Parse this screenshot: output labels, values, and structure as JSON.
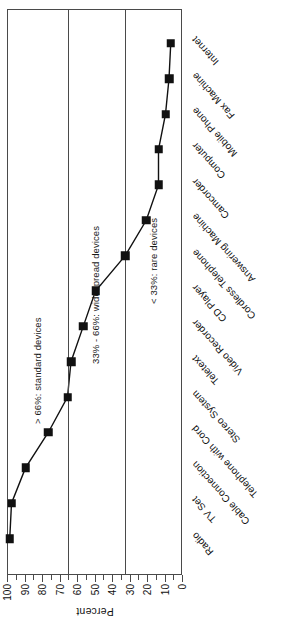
{
  "chart_data": {
    "type": "line",
    "title": "",
    "xlabel": "",
    "ylabel": "Percent",
    "ylim": [
      0,
      100
    ],
    "ytick_step": 10,
    "yticks": [
      0,
      10,
      20,
      30,
      40,
      50,
      60,
      70,
      80,
      90,
      100
    ],
    "ytick_labels": [
      "0",
      "10",
      "20",
      "30",
      "40",
      "50",
      "60",
      "70",
      "80",
      "90",
      "100"
    ],
    "grid": false,
    "legend": "none",
    "orientation": "rotated-90-ccw",
    "marker": "filled-square",
    "line_color": "#111111",
    "marker_color": "#111111",
    "frame_color": "#4a4a4a",
    "categories": [
      "Radio",
      "TV Set",
      "Cable Connection",
      "Telephone with Cord",
      "Stereo System",
      "Teletext",
      "Video Recorder",
      "CD Player",
      "Cordless Telephone",
      "Answering Machine",
      "Camcorder",
      "Computer",
      "Mobile Phone",
      "Fax Machine",
      "Internet"
    ],
    "values": [
      99,
      98,
      90,
      77,
      66,
      64,
      57,
      50,
      33,
      21,
      14,
      14,
      10,
      8,
      7
    ],
    "reference_lines": [
      {
        "value": 66,
        "label": "> 66%: standard devices"
      },
      {
        "value": 33,
        "label": "33% - 66%: widespread devices"
      },
      {
        "value": 0,
        "label": "< 33%: rare devices"
      }
    ],
    "zone_labels": [
      "> 66%: standard devices",
      "33% - 66%: widespread devices",
      "< 33%: rare devices"
    ]
  }
}
